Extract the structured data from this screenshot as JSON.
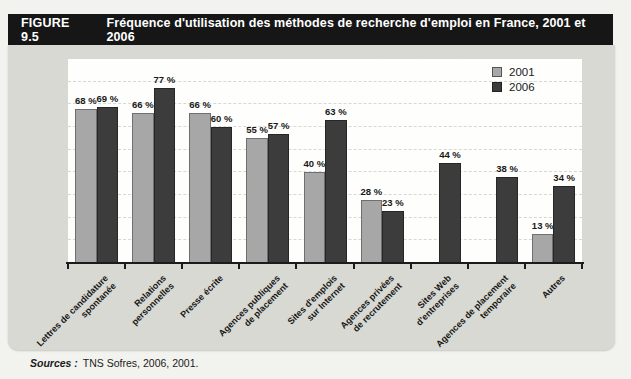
{
  "figure": {
    "label": "FIGURE 9.5",
    "title": "Fréquence d'utilisation des méthodes de recherche d'emploi en France, 2001 et 2006"
  },
  "source": {
    "prefix": "Sources :",
    "text": "TNS Sofres, 2006, 2001."
  },
  "colors": {
    "title_bar": "#161616",
    "panel": "#d8d9d2",
    "plot_background": "#fefefc",
    "series_2001": "#a7a7a7",
    "series_2006": "#3c3c3c"
  },
  "chart_data": {
    "type": "bar",
    "title": "Fréquence d'utilisation des méthodes de recherche d'emploi en France, 2001 et 2006",
    "xlabel": "",
    "ylabel": "",
    "ylim": [
      0,
      90
    ],
    "grid": "horizontal-dashed",
    "grid_step": 10,
    "legend_position": "top-right",
    "value_label_suffix": " %",
    "categories": [
      "Lettres de candidature spontanée",
      "Relations personnelles",
      "Presse écrite",
      "Agences publiques de placement",
      "Sites d'emplois sur Internet",
      "Agences privées de recrutement",
      "Sites Web d'entreprises",
      "Agences de placement temporaire",
      "Autres"
    ],
    "category_lines": [
      [
        "Lettres de candidature",
        "spontanée"
      ],
      [
        "Relations",
        "personnelles"
      ],
      [
        "Presse écrite"
      ],
      [
        "Agences publiques",
        "de placement"
      ],
      [
        "Sites d'emplois",
        "sur Internet"
      ],
      [
        "Agences privées",
        "de recrutement"
      ],
      [
        "Sites Web",
        "d'entreprises"
      ],
      [
        "Agences de placement",
        "temporaire"
      ],
      [
        "Autres"
      ]
    ],
    "series": [
      {
        "name": "2001",
        "color": "#a7a7a7",
        "values": [
          68,
          66,
          66,
          55,
          40,
          28,
          null,
          null,
          13
        ]
      },
      {
        "name": "2006",
        "color": "#3c3c3c",
        "values": [
          69,
          77,
          60,
          57,
          63,
          23,
          44,
          38,
          34
        ]
      }
    ]
  }
}
